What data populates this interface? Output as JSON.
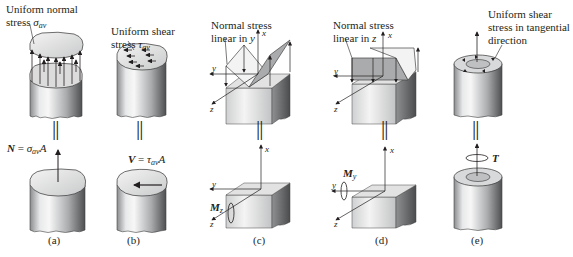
{
  "figure": {
    "panels": [
      {
        "id": "a",
        "caption": "(a)",
        "top_label_line1": "Uniform normal",
        "top_label_line2_prefix": "stress ",
        "top_symbol": "σ",
        "top_subscript": "av",
        "bottom_label_lhs": "N",
        "bottom_label_eq": " = ",
        "bottom_symbol": "σ",
        "bottom_subscript": "av",
        "bottom_suffix": "A"
      },
      {
        "id": "b",
        "caption": "(b)",
        "top_label_line1": "Uniform shear",
        "top_label_line2_prefix": "stress ",
        "top_symbol": "τ",
        "top_subscript": "av",
        "bottom_label_lhs": "V",
        "bottom_label_eq": " = ",
        "bottom_symbol": "τ",
        "bottom_subscript": "av",
        "bottom_suffix": "A"
      },
      {
        "id": "c",
        "caption": "(c)",
        "top_label_line1": "Normal stress",
        "top_label_line2_prefix": "linear in ",
        "top_label_var": "y",
        "axes": {
          "x": "x",
          "y": "y",
          "z": "z"
        },
        "moment_label": "M",
        "moment_subscript": "z"
      },
      {
        "id": "d",
        "caption": "(d)",
        "top_label_line1": "Normal stress",
        "top_label_line2_prefix": "linear in ",
        "top_label_var": "z",
        "axes": {
          "x": "x",
          "y": "y",
          "z": "z"
        },
        "moment_label": "M",
        "moment_subscript": "y"
      },
      {
        "id": "e",
        "caption": "(e)",
        "top_label_line1": "Uniform shear",
        "top_label_line2": "stress in tangential",
        "top_label_line3": "direction",
        "torque_label": "T"
      }
    ],
    "equivalence_symbol": "||"
  }
}
